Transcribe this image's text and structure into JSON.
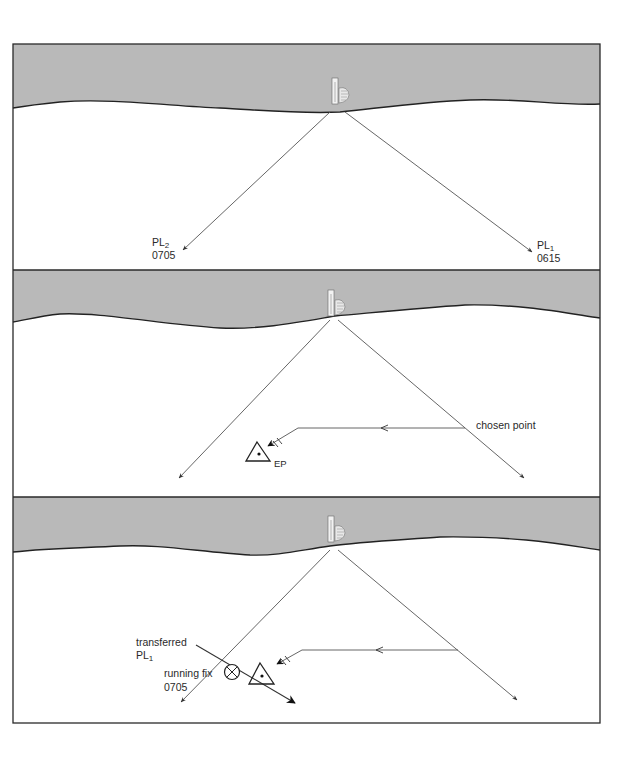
{
  "figure": {
    "colors": {
      "land": "#b9b9b9",
      "frame": "#2a2a2a",
      "line": "#555555",
      "paper": "#ffffff"
    },
    "panels": [
      {
        "id": "panel-1",
        "labels": {
          "pl2_main": "PL",
          "pl2_sub": "2",
          "pl2_time": "0705",
          "pl1_main": "PL",
          "pl1_sub": "1",
          "pl1_time": "0615"
        }
      },
      {
        "id": "panel-2",
        "labels": {
          "chosen_point": "chosen point",
          "ep": "EP"
        }
      },
      {
        "id": "panel-3",
        "labels": {
          "transferred": "transferred",
          "transferred_pl_main": "PL",
          "transferred_pl_sub": "1",
          "running_fix": "running fix",
          "running_fix_time": "0705"
        }
      }
    ],
    "icons": {
      "lighthouse": "lighthouse-icon",
      "estimated_position": "triangle-ep-icon",
      "fix": "circled-x-fix-icon"
    }
  }
}
